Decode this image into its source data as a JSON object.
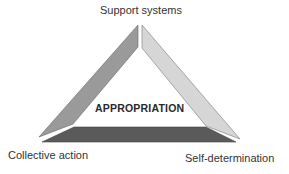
{
  "diagram": {
    "center_label": "APPROPRIATION",
    "vertices": {
      "top": "Support systems",
      "bottom_left": "Collective action",
      "bottom_right": "Self-determination"
    },
    "colors": {
      "left_bar": "#9a9a9a",
      "right_bar": "#d4d4d4",
      "bottom_bar": "#5a5a5a",
      "outline": "#666666",
      "text": "#333333"
    }
  }
}
